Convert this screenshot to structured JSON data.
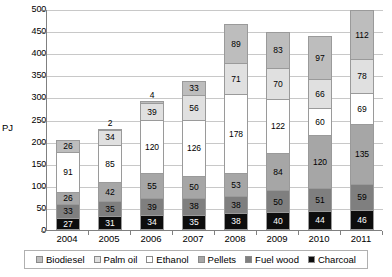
{
  "chart_data": {
    "type": "bar",
    "stacked": true,
    "title": "",
    "xlabel": "",
    "ylabel": "PJ",
    "ylim": [
      0,
      500
    ],
    "ytick_step": 50,
    "yticks": [
      "0",
      "50",
      "100",
      "150",
      "200",
      "250",
      "300",
      "350",
      "400",
      "450",
      "500"
    ],
    "grid": true,
    "legend_position": "bottom",
    "categories": [
      "2004",
      "2005",
      "2006",
      "2007",
      "2008",
      "2009",
      "2010",
      "2011"
    ],
    "stack_order_bottom_to_top": [
      "Charcoal",
      "Fuel wood",
      "Pellets",
      "Ethanol",
      "Palm oil",
      "Biodiesel"
    ],
    "series": [
      {
        "name": "Charcoal",
        "color": "#0d0d0d",
        "values": [
          27,
          31,
          34,
          35,
          38,
          40,
          44,
          46
        ]
      },
      {
        "name": "Fuel wood",
        "color": "#7f7f7f",
        "values": [
          33,
          35,
          39,
          38,
          38,
          50,
          51,
          59
        ]
      },
      {
        "name": "Pellets",
        "color": "#a6a6a6",
        "values": [
          26,
          42,
          55,
          50,
          53,
          84,
          120,
          135
        ]
      },
      {
        "name": "Ethanol",
        "color": "#ffffff",
        "values": [
          91,
          85,
          120,
          126,
          178,
          122,
          60,
          69
        ]
      },
      {
        "name": "Palm oil",
        "color": "#e0e0e0",
        "values": [
          0,
          34,
          39,
          56,
          71,
          70,
          66,
          78
        ]
      },
      {
        "name": "Biodiesel",
        "color": "#bdbdbd",
        "values": [
          26,
          2,
          4,
          33,
          89,
          83,
          97,
          112
        ]
      }
    ],
    "totals": [
      203,
      229,
      291,
      338,
      467,
      449,
      438,
      499
    ]
  },
  "legend": {
    "items": [
      {
        "label": "Biodiesel"
      },
      {
        "label": "Palm oil"
      },
      {
        "label": "Ethanol"
      },
      {
        "label": "Pellets"
      },
      {
        "label": "Fuel wood"
      },
      {
        "label": "Charcoal"
      }
    ]
  }
}
